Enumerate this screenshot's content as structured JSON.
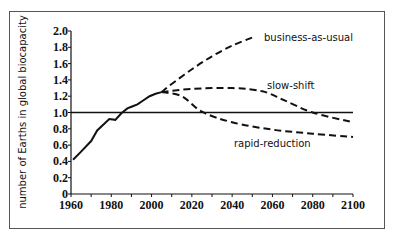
{
  "chart_data": {
    "type": "line",
    "title": "",
    "xlabel": "",
    "ylabel": "number of Earths in global biocapacity",
    "xlim": [
      1960,
      2100
    ],
    "ylim": [
      0,
      2.0
    ],
    "x_ticks": [
      "1960",
      "1980",
      "2000",
      "2020",
      "2040",
      "2060",
      "2080",
      "2100"
    ],
    "y_ticks": [
      "0",
      "0.2",
      "0.4",
      "0.6",
      "0.8",
      "1.0",
      "1.2",
      "1.4",
      "1.6",
      "1.8",
      "2.0"
    ],
    "grid": false,
    "legend": "inline labels",
    "series": [
      {
        "name": "historical",
        "style": "solid",
        "x": [
          1961,
          1965,
          1970,
          1973,
          1976,
          1979,
          1982,
          1985,
          1988,
          1990,
          1993,
          1996,
          1999,
          2002,
          2005
        ],
        "y": [
          0.42,
          0.52,
          0.65,
          0.78,
          0.85,
          0.92,
          0.91,
          0.99,
          1.05,
          1.07,
          1.1,
          1.15,
          1.2,
          1.23,
          1.25
        ]
      },
      {
        "name": "business-as-usual",
        "style": "dashed",
        "x": [
          2005,
          2010,
          2020,
          2030,
          2040,
          2050
        ],
        "y": [
          1.25,
          1.35,
          1.53,
          1.69,
          1.82,
          1.92
        ]
      },
      {
        "name": "slow-shift",
        "style": "dashed",
        "x": [
          2005,
          2020,
          2040,
          2055,
          2065,
          2080,
          2100
        ],
        "y": [
          1.25,
          1.29,
          1.3,
          1.26,
          1.16,
          1.0,
          0.88
        ]
      },
      {
        "name": "rapid-reduction",
        "style": "dashed",
        "x": [
          2005,
          2015,
          2025,
          2040,
          2060,
          2080,
          2100
        ],
        "y": [
          1.25,
          1.2,
          1.01,
          0.88,
          0.79,
          0.74,
          0.7
        ]
      },
      {
        "name": "biocapacity (1 Earth)",
        "style": "solid",
        "x": [
          1960,
          2100
        ],
        "y": [
          1.0,
          1.0
        ]
      }
    ],
    "annotations": [
      "business-as-usual",
      "slow-shift",
      "rapid-reduction"
    ]
  }
}
